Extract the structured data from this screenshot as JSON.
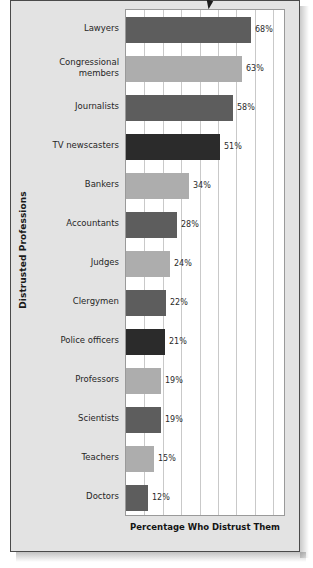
{
  "chart_data": {
    "type": "bar",
    "orientation": "horizontal",
    "title": "",
    "xlabel": "Percentage Who Distrust Them",
    "ylabel": "Distrusted Professions",
    "categories": [
      "Lawyers",
      "Congressional members",
      "Journalists",
      "TV newscasters",
      "Bankers",
      "Accountants",
      "Judges",
      "Clergymen",
      "Police officers",
      "Professors",
      "Scientists",
      "Teachers",
      "Doctors"
    ],
    "values": [
      68,
      63,
      58,
      51,
      34,
      28,
      24,
      22,
      21,
      19,
      19,
      15,
      12
    ],
    "value_labels": [
      "68%",
      "63%",
      "58%",
      "51%",
      "34%",
      "28%",
      "24%",
      "22%",
      "21%",
      "19%",
      "19%",
      "15%",
      "12%"
    ],
    "xlim": [
      0,
      87
    ],
    "grid": true,
    "gridline_step": 10,
    "legend": "none",
    "bar_colors": [
      "#5d5d5d",
      "#adadad",
      "#5d5d5d",
      "#2b2b2b",
      "#adadad",
      "#5d5d5d",
      "#adadad",
      "#5d5d5d",
      "#2b2b2b",
      "#adadad",
      "#5d5d5d",
      "#adadad",
      "#5d5d5d"
    ]
  },
  "palette": {
    "dark_gray": "#5d5d5d",
    "light_gray": "#adadad",
    "near_black": "#2b2b2b",
    "plate_bg": "#e3e3e3",
    "plot_bg": "#ffffff",
    "gridline": "#c9c9c9"
  },
  "marks": {
    "pointer": "triangle-pointer-icon"
  }
}
